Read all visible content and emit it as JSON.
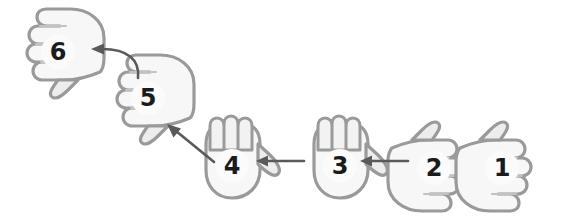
{
  "diagram": {
    "type": "sequence-flow",
    "orientation_note": "entire figure rotated 180 degrees",
    "background_color": "#ffffff",
    "palette": {
      "hand_fill": "#f7f7f7",
      "hand_fill_shadow": "#d8d8d8",
      "hand_outline": "#9a9a9a",
      "hand_outline_dark": "#7d7d7d",
      "bubble_fill": "#fbfbfb",
      "number_color": "#1b1b1b",
      "arrow_color": "#5a5a5a"
    },
    "steps": [
      {
        "id": "step-1",
        "number": "1",
        "fingers_shown": 1,
        "x": 452,
        "y": 118,
        "rotation": 180,
        "label_rotation": 180
      },
      {
        "id": "step-2",
        "number": "2",
        "fingers_shown": 2,
        "x": 384,
        "y": 118,
        "rotation": 180,
        "label_rotation": 180
      },
      {
        "id": "step-3",
        "number": "3",
        "fingers_shown": 3,
        "x": 292,
        "y": 112,
        "rotation": 180,
        "label_rotation": 180
      },
      {
        "id": "step-4",
        "number": "4",
        "fingers_shown": 4,
        "x": 184,
        "y": 112,
        "rotation": 180,
        "label_rotation": 180
      },
      {
        "id": "step-5",
        "number": "5",
        "fingers_shown": 5,
        "x": 98,
        "y": 48,
        "rotation": 180,
        "label_rotation": 180
      },
      {
        "id": "step-6",
        "number": "6",
        "fingers_shown": 6,
        "x": 8,
        "y": 2,
        "rotation": 180,
        "label_rotation": 180
      }
    ],
    "connectors": [
      {
        "id": "arrow-2-to-3",
        "from": "step-2",
        "to": "step-3",
        "shape": "straight",
        "direction": "leftward"
      },
      {
        "id": "arrow-3-to-4",
        "from": "step-3",
        "to": "step-4",
        "shape": "straight",
        "direction": "leftward"
      },
      {
        "id": "arrow-4-to-5",
        "from": "step-4",
        "to": "step-5",
        "shape": "straight-diagonal",
        "direction": "up-left"
      },
      {
        "id": "arrow-5-to-6",
        "from": "step-5",
        "to": "step-6",
        "shape": "curved",
        "direction": "up-left"
      }
    ]
  }
}
